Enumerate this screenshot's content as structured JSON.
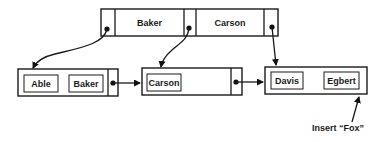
{
  "diagram": {
    "type": "B+ tree node split illustration",
    "root": {
      "keys": [
        "Baker",
        "Carson"
      ],
      "pointers": 3
    },
    "leaves": [
      {
        "keys": [
          "Able",
          "Baker"
        ]
      },
      {
        "keys": [
          "Carson"
        ]
      },
      {
        "keys": [
          "Davis",
          "Egbert"
        ]
      }
    ],
    "annotation": "Insert “Fox”",
    "colors": {
      "stroke": "#1a1a1a",
      "background": "#ffffff"
    }
  }
}
